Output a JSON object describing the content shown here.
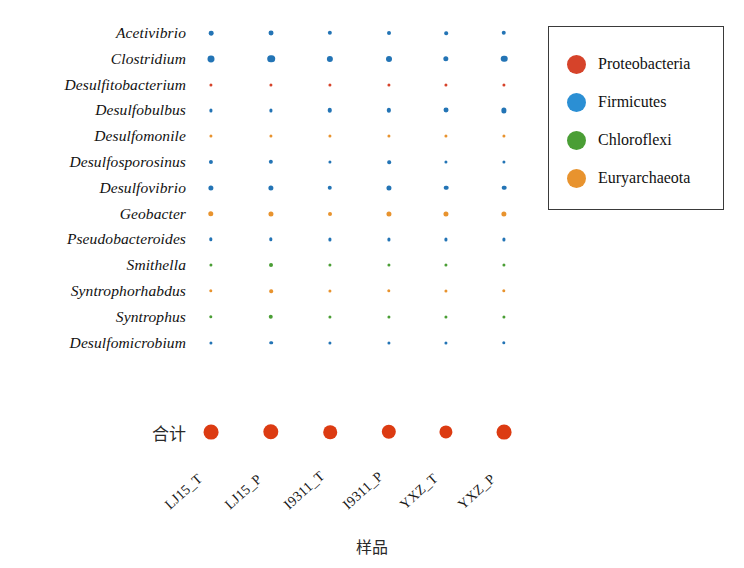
{
  "chart_data": {
    "type": "scatter",
    "title": "",
    "xlabel": "样品",
    "ylabel": "",
    "grid": false,
    "legend_position": "top-right",
    "bubble_note": "Bubble area encodes relative abundance; color encodes phylum.",
    "categories": [
      "LJ15_T",
      "LJ15_P",
      "I9311_T",
      "I9311_P",
      "YXZ_T",
      "YXZ_P"
    ],
    "genera": [
      "Acetivibrio",
      "Clostridium",
      "Desulfitobacterium",
      "Desulfobulbus",
      "Desulfomonile",
      "Desulfosporosinus",
      "Desulfovibrio",
      "Geobacter",
      "Pseudobacteroides",
      "Smithella",
      "Syntrophorhabdus",
      "Syntrophus",
      "Desulfomicrobium"
    ],
    "total_label": "合计",
    "phylum_by_genus": {
      "Acetivibrio": "Firmicutes",
      "Clostridium": "Firmicutes",
      "Desulfitobacterium": "Proteobacteria",
      "Desulfobulbus": "Firmicutes",
      "Desulfomonile": "Euryarchaeota",
      "Desulfosporosinus": "Firmicutes",
      "Desulfovibrio": "Firmicutes",
      "Geobacter": "Euryarchaeota",
      "Pseudobacteroides": "Firmicutes",
      "Smithella": "Chloroflexi",
      "Syntrophorhabdus": "Euryarchaeota",
      "Syntrophus": "Chloroflexi",
      "Desulfomicrobium": "Firmicutes",
      "合计": "Proteobacteria"
    },
    "series": [
      {
        "name": "Acetivibrio",
        "values": [
          15,
          17,
          13,
          11,
          9,
          14
        ]
      },
      {
        "name": "Clostridium",
        "values": [
          34,
          40,
          27,
          25,
          20,
          30
        ]
      },
      {
        "name": "Desulfitobacterium",
        "values": [
          6,
          5,
          3,
          3,
          3,
          3
        ]
      },
      {
        "name": "Desulfobulbus",
        "values": [
          3,
          4,
          14,
          13,
          17,
          19
        ]
      },
      {
        "name": "Desulfomonile",
        "values": [
          5,
          6,
          4,
          7,
          4,
          5
        ]
      },
      {
        "name": "Desulfosporosinus",
        "values": [
          12,
          13,
          7,
          9,
          6,
          5
        ]
      },
      {
        "name": "Desulfovibrio",
        "values": [
          19,
          19,
          14,
          18,
          15,
          15
        ]
      },
      {
        "name": "Geobacter",
        "values": [
          21,
          18,
          11,
          18,
          18,
          19
        ]
      },
      {
        "name": "Pseudobacteroides",
        "values": [
          8,
          8,
          6,
          5,
          7,
          7
        ]
      },
      {
        "name": "Smithella",
        "values": [
          3,
          11,
          3,
          3,
          3,
          6
        ]
      },
      {
        "name": "Syntrophorhabdus",
        "values": [
          8,
          9,
          7,
          8,
          4,
          8
        ]
      },
      {
        "name": "Syntrophus",
        "values": [
          8,
          14,
          3,
          4,
          4,
          5
        ]
      },
      {
        "name": "Desulfomicrobium",
        "values": [
          4,
          9,
          2,
          7,
          6,
          8
        ]
      },
      {
        "name": "合计",
        "values": [
          60,
          64,
          50,
          56,
          47,
          60
        ]
      }
    ]
  },
  "legend": {
    "entries": [
      {
        "label": "Proteobacteria",
        "color": "#d6432a"
      },
      {
        "label": "Firmicutes",
        "color": "#2b8fd4"
      },
      {
        "label": "Chloroflexi",
        "color": "#4a9e35"
      },
      {
        "label": "Euryarchaeota",
        "color": "#e8932e"
      }
    ]
  },
  "palette": {
    "Proteobacteria": "#d6432a",
    "Firmicutes": "#2374b5",
    "Chloroflexi": "#4a9e35",
    "Euryarchaeota": "#e8932e",
    "total": "#dc3b12",
    "background": "#ffffff",
    "text": "#111111"
  },
  "axis": {
    "x_title": "样品"
  }
}
